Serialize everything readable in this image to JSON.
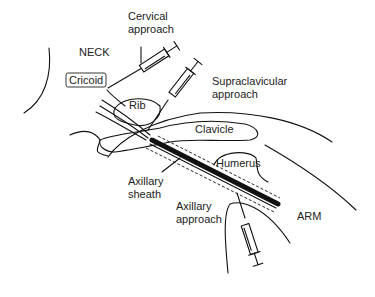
{
  "diagram": {
    "labels": {
      "cervical_line1": "Cervical",
      "cervical_line2": "approach",
      "neck": "NECK",
      "cricoid": "Cricoid",
      "rib": "Rib",
      "supraclavicular_line1": "Supraclavicular",
      "supraclavicular_line2": "approach",
      "clavicle": "Clavicle",
      "humerus": "Humerus",
      "axillary_sheath_line1": "Axillary",
      "axillary_sheath_line2": "sheath",
      "axillary_approach_line1": "Axillary",
      "axillary_approach_line2": "approach",
      "arm": "ARM"
    },
    "colors": {
      "line": "#111111",
      "text": "#222222",
      "background": "#ffffff"
    }
  }
}
